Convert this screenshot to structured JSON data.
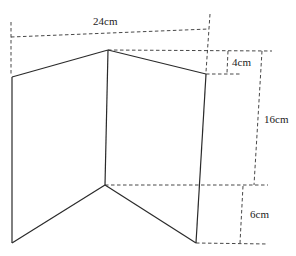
{
  "diagram": {
    "type": "folded-screen",
    "labels": {
      "width": "24cm",
      "top_offset": "4cm",
      "height": "16cm",
      "bottom_offset": "6cm"
    },
    "vertices": {
      "top_left": [
        12,
        77
      ],
      "top_middle": [
        108,
        50
      ],
      "top_right": [
        206,
        74
      ],
      "bottom_left": [
        12,
        243
      ],
      "bottom_middle": [
        105,
        185
      ],
      "bottom_right": [
        196,
        243
      ]
    },
    "colors": {
      "line": "#2a2a2a",
      "dash": "#333333",
      "text": "#222222",
      "background": "#ffffff"
    }
  }
}
